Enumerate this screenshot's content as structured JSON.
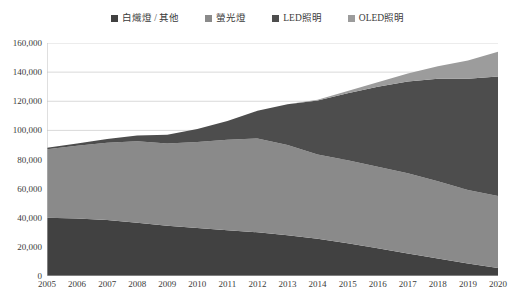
{
  "chart_data": {
    "type": "area",
    "stacked": true,
    "title": "",
    "subtitle": "",
    "xlabel": "",
    "ylabel": "",
    "grid": true,
    "legend_position": "top-center",
    "categories": [
      "2005",
      "2006",
      "2007",
      "2008",
      "2009",
      "2010",
      "2011",
      "2012",
      "2013",
      "2014",
      "2015",
      "2016",
      "2017",
      "2018",
      "2019",
      "2020"
    ],
    "x": [
      2005,
      2006,
      2007,
      2008,
      2009,
      2010,
      2011,
      2012,
      2013,
      2014,
      2015,
      2016,
      2017,
      2018,
      2019,
      2020
    ],
    "ylim": [
      0,
      160000
    ],
    "y_ticks": [
      0,
      20000,
      40000,
      60000,
      80000,
      100000,
      120000,
      140000,
      160000
    ],
    "y_tick_labels": [
      "0",
      "20,000",
      "40,000",
      "60,000",
      "80,000",
      "100,000",
      "120,000",
      "140,000",
      "160,000"
    ],
    "series": [
      {
        "name": "白熾燈 / 其他",
        "color": "#414141",
        "values": [
          40000,
          39500,
          38500,
          36500,
          34500,
          33000,
          31500,
          30000,
          28000,
          25500,
          22500,
          19000,
          15500,
          12000,
          8500,
          5500
        ]
      },
      {
        "name": "螢光燈",
        "color": "#8a8a8a",
        "values": [
          47000,
          50000,
          53000,
          56000,
          56500,
          59000,
          62000,
          64500,
          62000,
          58000,
          57000,
          56000,
          55000,
          53000,
          50500,
          49500
        ]
      },
      {
        "name": "LED照明",
        "color": "#4d4d4d",
        "values": [
          1000,
          1500,
          2500,
          4000,
          6000,
          9000,
          13000,
          19000,
          28000,
          37000,
          46000,
          55000,
          63000,
          70500,
          76500,
          82000
        ]
      },
      {
        "name": "OLED照明",
        "color": "#9c9c9c",
        "values": [
          0,
          0,
          0,
          0,
          0,
          0,
          0,
          0,
          0,
          500,
          1500,
          3000,
          5500,
          8500,
          12500,
          17000
        ]
      }
    ]
  },
  "legend": {
    "items": [
      {
        "label": "白熾燈 / 其他",
        "swatch": "legend-swatch-incandescent-other",
        "color": "#414141"
      },
      {
        "label": "螢光燈",
        "swatch": "legend-swatch-fluorescent",
        "color": "#8a8a8a"
      },
      {
        "label": "LED照明",
        "swatch": "legend-swatch-led",
        "color": "#4d4d4d"
      },
      {
        "label": "OLED照明",
        "swatch": "legend-swatch-oled",
        "color": "#9c9c9c"
      }
    ]
  },
  "axes": {
    "y_tick_labels": [
      "160,000",
      "140,000",
      "120,000",
      "100,000",
      "80,000",
      "60,000",
      "40,000",
      "20,000",
      "0"
    ],
    "x_tick_labels": [
      "2005",
      "2006",
      "2007",
      "2008",
      "2009",
      "2010",
      "2011",
      "2012",
      "2013",
      "2014",
      "2015",
      "2016",
      "2017",
      "2018",
      "2019",
      "2020"
    ]
  },
  "style": {
    "grid_color": "#d9d9d9",
    "axis_color": "#bfbfbf",
    "text_color": "#3b3b3b",
    "background": "#ffffff"
  }
}
